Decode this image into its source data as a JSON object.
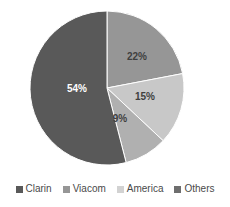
{
  "chart_data": {
    "type": "pie",
    "title": "",
    "xlabel": "",
    "ylabel": "",
    "categories": [
      "Clarin",
      "Viacom",
      "America",
      "Others"
    ],
    "values": [
      54,
      22,
      15,
      9
    ],
    "unit": "%",
    "data_labels": [
      "54%",
      "22%",
      "15%",
      "9%"
    ],
    "colors": [
      "#595959",
      "#969696",
      "#c8c8c8",
      "#b0b0b0"
    ],
    "legend_position": "bottom",
    "grid": false,
    "start_angle_deg": 0,
    "direction": "clockwise",
    "slices": [
      {
        "name": "Viacom",
        "value": 22,
        "label": "22%",
        "color": "#969696",
        "label_color": "#3f3f3f",
        "label_x": 137,
        "label_y": 57
      },
      {
        "name": "America",
        "value": 15,
        "label": "15%",
        "color": "#c8c8c8",
        "label_color": "#3f3f3f",
        "label_x": 145,
        "label_y": 97
      },
      {
        "name": "Others",
        "value": 9,
        "label": "9%",
        "color": "#b0b0b0",
        "label_color": "#3f3f3f",
        "label_x": 120,
        "label_y": 119
      },
      {
        "name": "Clarin",
        "value": 54,
        "label": "54%",
        "color": "#595959",
        "label_color": "#ffffff",
        "label_x": 77,
        "label_y": 89
      }
    ],
    "geometry": {
      "center_x": 107,
      "center_y": 88,
      "radius": 77
    }
  },
  "legend": {
    "items": [
      {
        "label": "Clarin",
        "color": "#595959"
      },
      {
        "label": "Viacom",
        "color": "#969696"
      },
      {
        "label": "America",
        "color": "#d2d2d2"
      },
      {
        "label": "Others",
        "color": "#6e6e6e"
      }
    ]
  }
}
